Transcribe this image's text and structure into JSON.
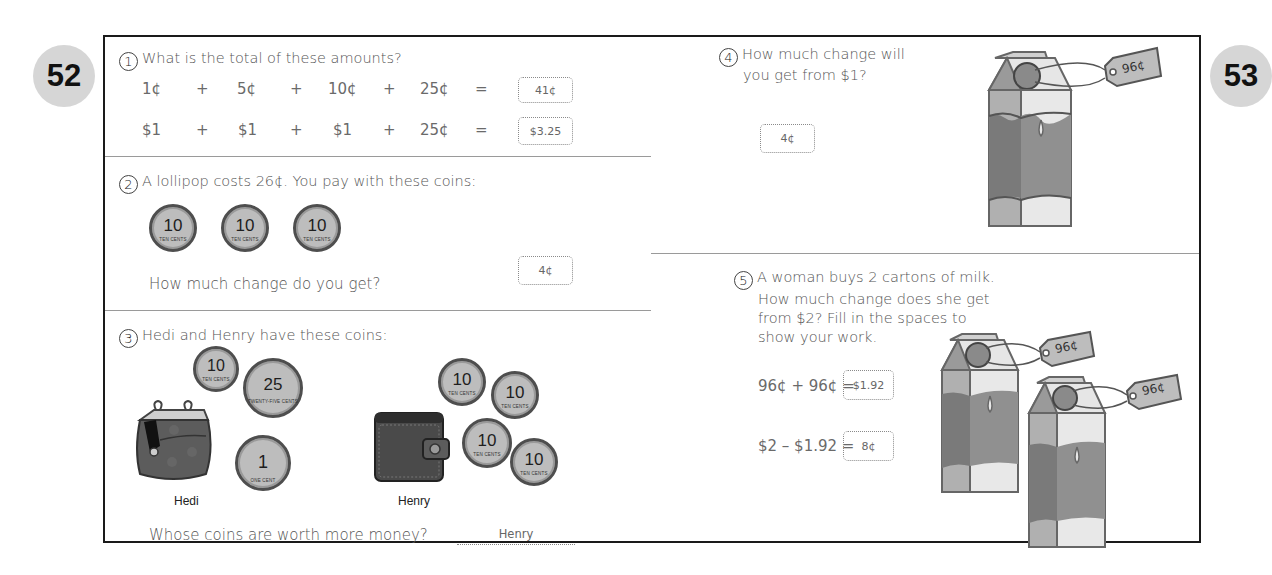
{
  "pages": {
    "left_number": "52",
    "right_number": "53"
  },
  "q1": {
    "number": "1",
    "prompt": "What is the total of these amounts?",
    "row1": {
      "terms": [
        "1¢",
        "+",
        "5¢",
        "+",
        "10¢",
        "+",
        "25¢",
        "="
      ],
      "answer": "41¢"
    },
    "row2": {
      "terms": [
        "$1",
        "+",
        "$1",
        "+",
        "$1",
        "+",
        "25¢",
        "="
      ],
      "answer": "$3.25"
    }
  },
  "q2": {
    "number": "2",
    "prompt": "A lollipop costs 26¢. You pay with these coins:",
    "coins": [
      {
        "value": "10",
        "caption": "TEN CENTS"
      },
      {
        "value": "10",
        "caption": "TEN CENTS"
      },
      {
        "value": "10",
        "caption": "TEN CENTS"
      }
    ],
    "question": "How much change do you get?",
    "answer": "4¢"
  },
  "q3": {
    "number": "3",
    "prompt": "Hedi and Henry have these coins:",
    "hedi": {
      "name": "Hedi",
      "coins": [
        {
          "value": "10",
          "caption": "TEN CENTS"
        },
        {
          "value": "25",
          "caption": "TWENTY-FIVE CENTS"
        },
        {
          "value": "1",
          "caption": "ONE CENT"
        }
      ]
    },
    "henry": {
      "name": "Henry",
      "coins": [
        {
          "value": "10",
          "caption": "TEN CENTS"
        },
        {
          "value": "10",
          "caption": "TEN CENTS"
        },
        {
          "value": "10",
          "caption": "TEN CENTS"
        },
        {
          "value": "10",
          "caption": "TEN CENTS"
        }
      ]
    },
    "question": "Whose coins are worth more money?",
    "answer": "Henry"
  },
  "q4": {
    "number": "4",
    "prompt_line1": "How much change will",
    "prompt_line2": "you get from $1?",
    "answer": "4¢",
    "price_tag": "96¢"
  },
  "q5": {
    "number": "5",
    "prompt_lines": [
      "A woman buys 2 cartons of milk.",
      "How much change does she get",
      "from $2? Fill in the spaces to",
      "show your work."
    ],
    "eq1": {
      "expr": "96¢ + 96¢ =",
      "answer": "$1.92"
    },
    "eq2": {
      "expr": "$2 – $1.92 =",
      "answer": "8¢"
    },
    "price_tags": [
      "96¢",
      "96¢"
    ]
  },
  "colors": {
    "badge": "#d6d6d6",
    "frame": "#1a1a1a",
    "coin": "#bdbdbd",
    "carton_dark": "#7a7a7a"
  }
}
